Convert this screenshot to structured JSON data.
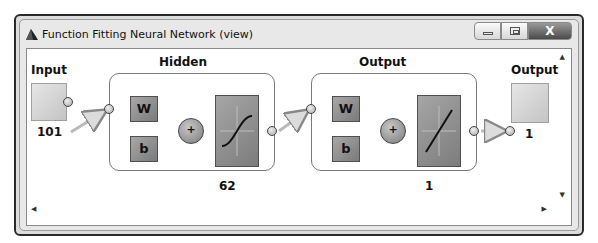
{
  "window": {
    "title": "Function Fitting Neural Network (view)",
    "icon": "matlab-icon",
    "controls": {
      "minimize": "minimize-icon",
      "maximize": "maximize-icon",
      "close": "X"
    }
  },
  "diagram": {
    "input": {
      "label": "Input",
      "size": "101"
    },
    "hidden": {
      "title": "Hidden",
      "weight_label": "W",
      "bias_label": "b",
      "sum_label": "+",
      "transfer": "tansig-icon",
      "size": "62"
    },
    "output_layer": {
      "title": "Output",
      "weight_label": "W",
      "bias_label": "b",
      "sum_label": "+",
      "transfer": "purelin-icon",
      "size": "1"
    },
    "output": {
      "label": "Output",
      "size": "1"
    }
  },
  "scrollbars": {
    "up": "▲",
    "down": "▼",
    "left": "◀",
    "right": "▶"
  }
}
